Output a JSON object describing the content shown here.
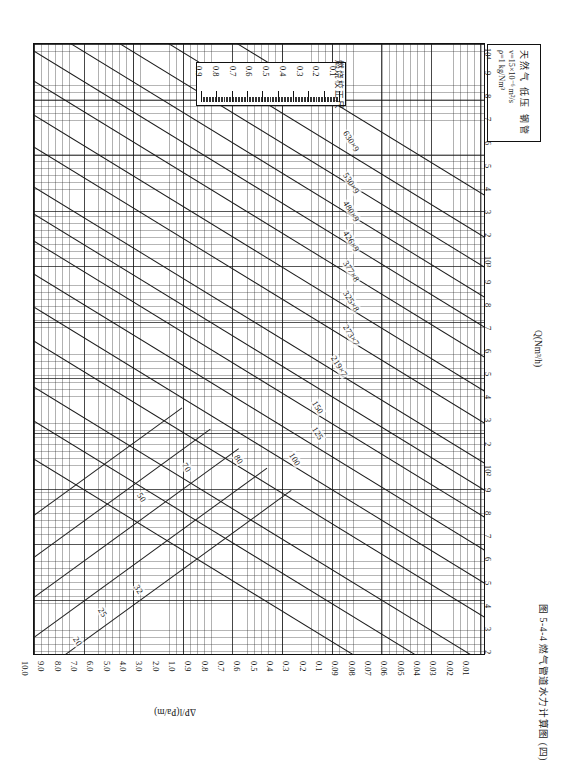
{
  "figure": {
    "caption": "图 5-4-4  燃气管道水力计算图 (四)"
  },
  "legend": {
    "title": "天然气  低压  钢管",
    "viscosity": "v=15×10⁻⁶ m²/s",
    "density": "ρ=1 kg/Nm³"
  },
  "ruler": {
    "label": "燃烧校正尺",
    "values": [
      "0.9",
      "0.8",
      "0.7",
      "0.6",
      "0.5",
      "0.4",
      "0.3",
      "0.2",
      "0.1"
    ]
  },
  "axes": {
    "q_title": "Q(Nm³/h)",
    "p_title": "ΔP/l(Pa/m)",
    "q_ticks": [
      "2",
      "3",
      "4",
      "5",
      "6",
      "7",
      "8",
      "9",
      "10³",
      "2",
      "3",
      "4",
      "5",
      "6",
      "7",
      "8",
      "9",
      "10⁴"
    ],
    "q_ticks_low": [
      "2",
      "3",
      "4",
      "5",
      "6",
      "7",
      "8",
      "9",
      "10²"
    ],
    "p_ticks": [
      "10.0",
      "9.0",
      "8.0",
      "7.0",
      "6.0",
      "5.0",
      "4.0",
      "3.0",
      "2.0",
      "1.0",
      "0.9",
      "0.8",
      "0.7",
      "0.6",
      "0.5",
      "0.4",
      "0.3",
      "0.2",
      "0.1",
      "0.09",
      "0.08",
      "0.07",
      "0.06",
      "0.05",
      "0.04",
      "0.03",
      "0.02",
      "0.01"
    ]
  },
  "chart_data": {
    "type": "line",
    "title": "图 5-4-4  燃气管道水力计算图 (四)",
    "subtitle": "天然气  低压  钢管   v=15×10⁻⁶ m²/s   ρ=1 kg/Nm³",
    "xlabel": "Q(Nm³/h)",
    "ylabel": "ΔP/l(Pa/m)",
    "xscale": "log",
    "yscale": "log",
    "xlim": [
      100,
      10000
    ],
    "ylim": [
      0.01,
      10.0
    ],
    "grid": true,
    "legend_position": "inline-labels",
    "series": [
      {
        "name": "630×9",
        "kind": "diameter"
      },
      {
        "name": "530×9",
        "kind": "diameter"
      },
      {
        "name": "480×9",
        "kind": "diameter"
      },
      {
        "name": "426×9",
        "kind": "diameter"
      },
      {
        "name": "377×8",
        "kind": "diameter"
      },
      {
        "name": "325×8",
        "kind": "diameter"
      },
      {
        "name": "273×7",
        "kind": "diameter"
      },
      {
        "name": "219×7",
        "kind": "diameter"
      },
      {
        "name": "150",
        "kind": "diameter"
      },
      {
        "name": "125",
        "kind": "diameter"
      },
      {
        "name": "100",
        "kind": "diameter"
      },
      {
        "name": "80",
        "kind": "diameter"
      },
      {
        "name": "70",
        "kind": "diameter"
      },
      {
        "name": "50",
        "kind": "diameter"
      },
      {
        "name": "32",
        "kind": "diameter"
      },
      {
        "name": "25",
        "kind": "diameter"
      },
      {
        "name": "20",
        "kind": "diameter"
      }
    ],
    "velocity_lines": [
      "v"
    ],
    "annotations": [
      "燃烧校正尺 inset scale 0.1–0.9"
    ]
  },
  "diameters": [
    {
      "label": "630×9",
      "lx": 349,
      "ly": 128,
      "rot": 58
    },
    {
      "label": "530×9",
      "lx": 349,
      "ly": 170,
      "rot": 58
    },
    {
      "label": "480×9",
      "lx": 349,
      "ly": 198,
      "rot": 58
    },
    {
      "label": "426×9",
      "lx": 349,
      "ly": 228,
      "rot": 58
    },
    {
      "label": "377×8",
      "lx": 349,
      "ly": 258,
      "rot": 58
    },
    {
      "label": "325×8",
      "lx": 349,
      "ly": 288,
      "rot": 58
    },
    {
      "label": "273×7",
      "lx": 349,
      "ly": 322,
      "rot": 58
    },
    {
      "label": "219×7",
      "lx": 337,
      "ly": 353,
      "rot": 58
    },
    {
      "label": "150",
      "lx": 318,
      "ly": 398,
      "rot": 58
    },
    {
      "label": "125",
      "lx": 318,
      "ly": 424,
      "rot": 58
    },
    {
      "label": "100",
      "lx": 295,
      "ly": 450,
      "rot": 58
    },
    {
      "label": "80",
      "lx": 240,
      "ly": 452,
      "rot": 58
    },
    {
      "label": "70",
      "lx": 188,
      "ly": 460,
      "rot": 58
    },
    {
      "label": "50",
      "lx": 143,
      "ly": 490,
      "rot": 58
    },
    {
      "label": "32",
      "lx": 140,
      "ly": 582,
      "rot": 58
    },
    {
      "label": "25",
      "lx": 104,
      "ly": 605,
      "rot": 58
    },
    {
      "label": "20",
      "lx": 79,
      "ly": 634,
      "rot": 58
    }
  ]
}
